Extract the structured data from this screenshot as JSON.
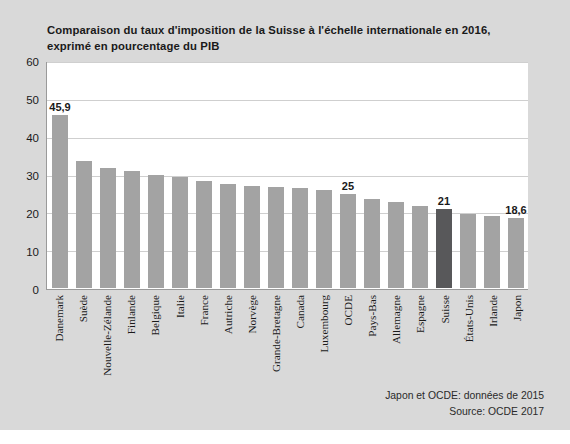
{
  "chart_data": {
    "type": "bar",
    "title": "Comparaison du taux d'imposition de la Suisse à l'échelle internationale en 2016, exprimé en pourcentage du PIB",
    "xlabel": "",
    "ylabel": "",
    "ylim": [
      0,
      60
    ],
    "yticks": [
      60,
      50,
      40,
      30,
      20,
      10,
      0
    ],
    "grid": true,
    "legend": null,
    "categories": [
      "Danemark",
      "Suède",
      "Nouvelle-Zélande",
      "Finlande",
      "Belgique",
      "Italie",
      "France",
      "Autriche",
      "Norvège",
      "Grande-Bretagne",
      "Canada",
      "Luxembourg",
      "OCDE",
      "Pays-Bas",
      "Allemagne",
      "Espagne",
      "Suisse",
      "États-Unis",
      "Irlande",
      "Japon"
    ],
    "values": [
      45.9,
      33.8,
      31.8,
      31.0,
      30.0,
      29.6,
      28.3,
      27.7,
      27.2,
      26.8,
      26.5,
      26.0,
      25.0,
      23.5,
      22.8,
      21.7,
      21.0,
      19.7,
      19.0,
      18.6
    ],
    "data_labels": {
      "0": "45,9",
      "12": "25",
      "16": "21",
      "19": "18,6"
    },
    "highlight_index": 16,
    "colors": {
      "bar": "#a3a3a3",
      "bar_highlight": "#58585a",
      "background": "#d9d9d9",
      "plot_background": "#ffffff",
      "gridline": "#cfcfcf",
      "axis": "#9a9a9a",
      "text": "#1a1a1a"
    },
    "annotations": [
      "Japon et OCDE: données de 2015",
      "Source: OCDE 2017"
    ]
  },
  "footnotes": {
    "note": "Japon et OCDE: données de 2015",
    "source": "Source: OCDE 2017"
  }
}
